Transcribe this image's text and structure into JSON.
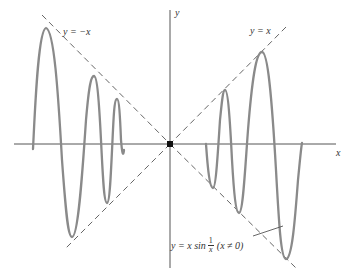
{
  "diagram": {
    "axes": {
      "x_label": "x",
      "y_label": "y"
    },
    "lines": {
      "neg_diag_label": "y = −x",
      "pos_diag_label": "y = x"
    },
    "curve_label": {
      "lhs": "y = x sin",
      "frac_num": "1",
      "frac_den": "x",
      "condition": "(x ≠ 0)"
    },
    "colors": {
      "curve": "#8a8a8a",
      "axes": "#555555",
      "dashed": "#555555",
      "origin_dot": "#111111",
      "text": "#333333"
    }
  }
}
